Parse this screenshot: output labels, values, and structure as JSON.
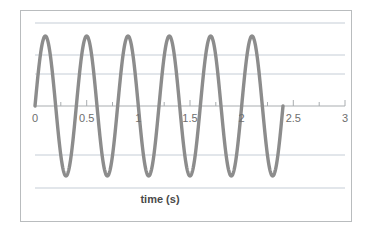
{
  "chart_data": {
    "type": "line",
    "title": "",
    "xlabel": "time (s)",
    "ylabel": "",
    "xlim": [
      0,
      3
    ],
    "ylim": [
      -1.2,
      1.2
    ],
    "grid": true,
    "legend": false,
    "x_tick_labels": [
      "0",
      "0.5",
      "1",
      "1.5",
      "2",
      "2.5",
      "3"
    ],
    "x_tick_values": [
      0,
      0.5,
      1,
      1.5,
      2,
      2.5,
      3
    ],
    "x_minor_tick_values": [
      0.25,
      0.75,
      1.25,
      1.75,
      2.25,
      2.75
    ],
    "y_gridline_values": [
      1.18,
      0.73,
      0.45,
      0,
      -0.7,
      -1.17
    ],
    "series": [
      {
        "name": "wave",
        "color": "#8c8c8c",
        "line_width": 3.4,
        "amplitude": 1.0,
        "period": 0.4,
        "frequency_hz": 2.5,
        "phase_deg": 0,
        "x_start": 0.0,
        "x_end": 2.4,
        "peak_count": 6,
        "trough_count": 5,
        "peaks_x": [
          0.1,
          0.5,
          0.9,
          1.3,
          1.7,
          2.1
        ],
        "troughs_x": [
          0.3,
          0.7,
          1.1,
          1.5,
          1.9
        ],
        "zero_crossings_x": [
          0.0,
          0.2,
          0.4,
          0.6,
          0.8,
          1.0,
          1.2,
          1.4,
          1.6,
          1.8,
          2.0,
          2.2,
          2.4
        ]
      }
    ]
  },
  "axis": {
    "label": "time (s)",
    "line_color": "#a9adb0"
  },
  "frame": {
    "border_color": "#b9bcbe"
  },
  "colors": {
    "wave": "#8c8c8c",
    "gridline": "#c5cdd6",
    "tick_text": "#6e6e6e",
    "axis_title": "#4a4a4a",
    "background": "#ffffff"
  }
}
